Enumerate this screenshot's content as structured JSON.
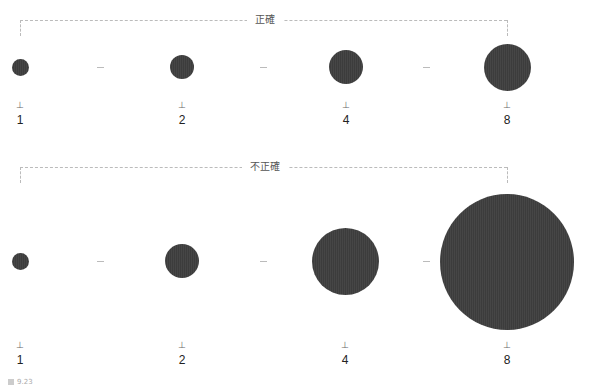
{
  "top_section": {
    "heading": "正確",
    "description": "circle area proportional to value",
    "items": [
      {
        "label": "1",
        "cx": 20,
        "diameter": 17
      },
      {
        "label": "2",
        "cx": 182,
        "diameter": 24
      },
      {
        "label": "4",
        "cx": 346,
        "diameter": 34
      },
      {
        "label": "8",
        "cx": 507,
        "diameter": 47
      }
    ]
  },
  "bottom_section": {
    "heading": "不正確",
    "description": "circle diameter proportional to value",
    "items": [
      {
        "label": "1",
        "cx": 20,
        "diameter": 17
      },
      {
        "label": "2",
        "cx": 182,
        "diameter": 34
      },
      {
        "label": "4",
        "cx": 345,
        "diameter": 67
      },
      {
        "label": "8",
        "cx": 507,
        "diameter": 134
      }
    ]
  },
  "tick_glyph": "⊥",
  "caption": "9.23",
  "colors": {
    "circle": "#3c3c3c",
    "bracket": "#bbbbbb",
    "text": "#222222"
  }
}
